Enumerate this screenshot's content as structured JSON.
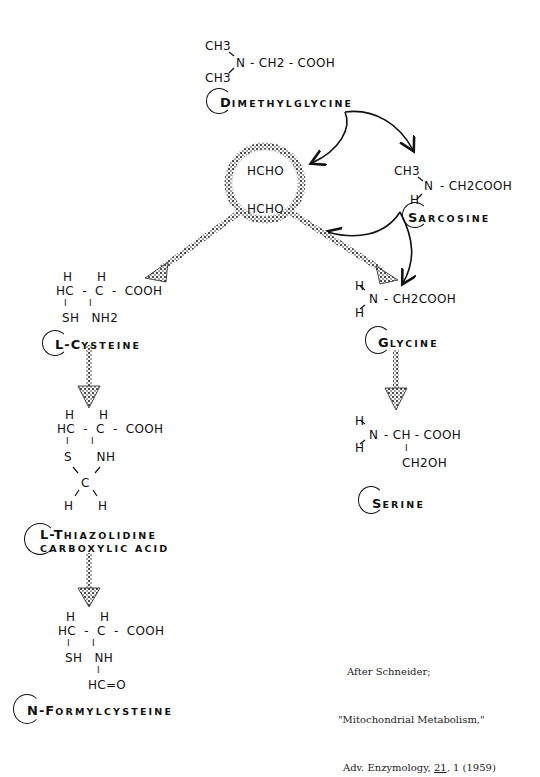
{
  "compounds": {
    "dimethylglycine": {
      "label_initial": "D",
      "label_rest": "IMETHYLGLYCINE",
      "formula": {
        "ch3_top": "CH3",
        "ch3_bottom": "CH3",
        "n": "N",
        "chain": "- CH2 - COOH"
      }
    },
    "sarcosine": {
      "label_initial": "S",
      "label_rest": "ARCOSINE",
      "formula": {
        "ch3": "CH3",
        "h": "H",
        "n": "N",
        "chain": "- CH2COOH"
      }
    },
    "formaldehyde_pool": {
      "top": "HCHO",
      "bottom": "HCHO"
    },
    "l_cysteine": {
      "label_initial": "L-C",
      "label_rest": "YSTEINE",
      "formula": {
        "row1": "H      H",
        "row2": "HC  -  C  -  COOH",
        "row3": "I       I",
        "row4": "SH   NH2"
      }
    },
    "glycine": {
      "label_initial": "G",
      "label_rest": "LYCINE",
      "formula": {
        "h_top": "H",
        "h_bottom": "H",
        "n": "N",
        "chain": "- CH2COOH"
      }
    },
    "thiazolidine": {
      "label_line1_initial": "L-T",
      "label_line1_rest": "HIAZOLIDINE",
      "label_line2": "CARBOXYLIC ACID",
      "formula": {
        "row1": "H      H",
        "row2": "HC  -  C  -  COOH",
        "row3": "I       I",
        "row4": "S      NH",
        "row5": "C",
        "row6": "H      H"
      }
    },
    "serine": {
      "label_initial": "S",
      "label_rest": "ERINE",
      "formula": {
        "h_top": "H",
        "h_bottom": "H",
        "n": "N",
        "chain": "- CH - COOH",
        "bar": "I",
        "side": "CH2OH"
      }
    },
    "n_formylcysteine": {
      "label_initial": "N-F",
      "label_rest": "ORMYLCYSTEINE",
      "formula": {
        "row1": "H      H",
        "row2": "HC  -  C  -  COOH",
        "row3": "I       I",
        "row4": "SH   NH",
        "row5": "I",
        "row6": "HC=O"
      }
    }
  },
  "citation": {
    "line1": "After Schneider;",
    "line2": "\"Mitochondrial Metabolism,\"",
    "line3_prefix": "Adv. Enzymology, ",
    "line3_volume": "21",
    "line3_suffix": ", 1 (1959)"
  },
  "colors": {
    "ink": "#111111",
    "background": "#ffffff"
  }
}
